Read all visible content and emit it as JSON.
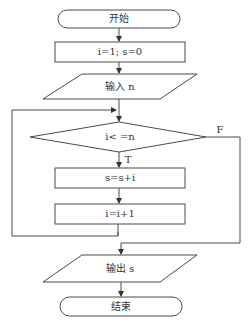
{
  "diagram": {
    "type": "flowchart",
    "nodes": {
      "start": {
        "shape": "terminal",
        "label": "开始"
      },
      "init": {
        "shape": "process",
        "label": "i=1; s=0"
      },
      "input": {
        "shape": "io",
        "label": "输入 n"
      },
      "condition": {
        "shape": "decision",
        "label": "i< =n"
      },
      "accumulate": {
        "shape": "process",
        "label": "s=s+i"
      },
      "increment": {
        "shape": "process",
        "label": "i=i+1"
      },
      "output": {
        "shape": "io",
        "label": "输出 s"
      },
      "end": {
        "shape": "terminal",
        "label": "结束"
      }
    },
    "edge_labels": {
      "true": "T",
      "false": "F"
    },
    "edges": [
      {
        "from": "start",
        "to": "init"
      },
      {
        "from": "init",
        "to": "input"
      },
      {
        "from": "input",
        "to": "condition"
      },
      {
        "from": "condition",
        "to": "accumulate",
        "label": "T"
      },
      {
        "from": "accumulate",
        "to": "increment"
      },
      {
        "from": "increment",
        "to": "condition",
        "note": "loop back"
      },
      {
        "from": "condition",
        "to": "output",
        "label": "F"
      },
      {
        "from": "output",
        "to": "end"
      }
    ]
  }
}
